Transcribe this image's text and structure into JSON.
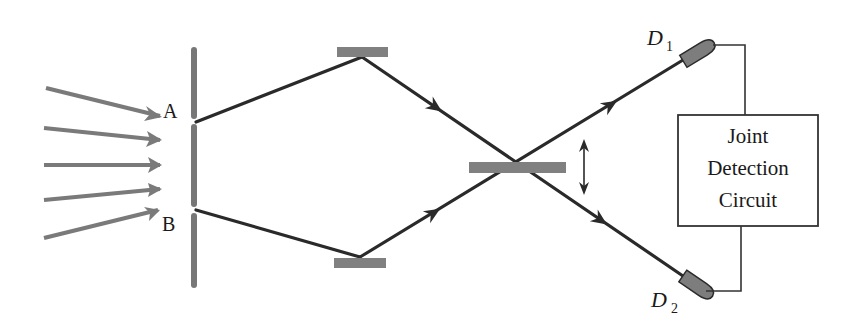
{
  "diagram": {
    "type": "two-photon interference / Hong-Ou-Mandel style setup",
    "labels": {
      "slit_a": "A",
      "slit_b": "B",
      "detector_1": "D",
      "detector_1_sub": "1",
      "detector_2": "D",
      "detector_2_sub": "2"
    },
    "circuit_box": {
      "lines": [
        "Joint",
        "Detection",
        "Circuit"
      ]
    },
    "components": [
      "incident-light-arrows",
      "double-slit-barrier",
      "top-mirror",
      "bottom-mirror",
      "beam-splitter",
      "movement-arrow",
      "detector-d1",
      "detector-d2",
      "joint-detection-circuit"
    ],
    "colors": {
      "beam": "#2a2a2a",
      "incident_arrows": "#7a7a7a",
      "barrier": "#777777",
      "mirror": "#808080",
      "detector": "#7d7d7d",
      "box_border": "#333333"
    }
  }
}
